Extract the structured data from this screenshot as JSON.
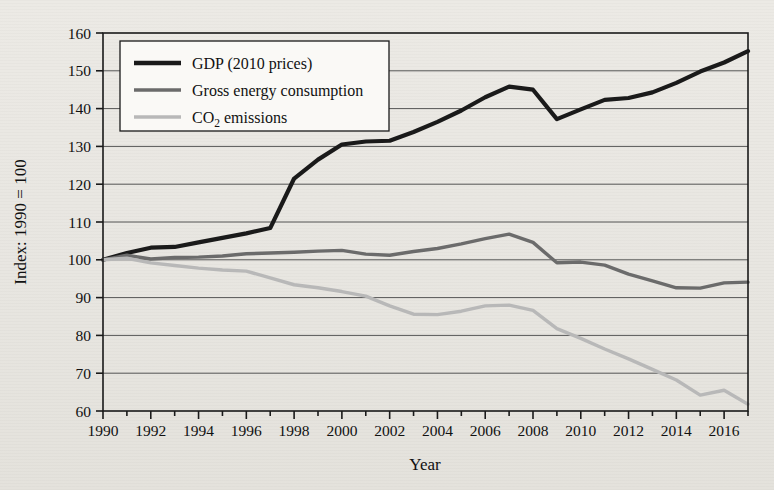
{
  "chart_data": {
    "type": "line",
    "title": "",
    "xlabel": "Year",
    "ylabel": "Index: 1990 = 100",
    "xlim": [
      1990,
      2017
    ],
    "ylim": [
      60,
      160
    ],
    "ytick_step": 10,
    "xtick_label_step": 2,
    "xtick_minor_step": 1,
    "grid": "horizontal",
    "legend_position": "top-left",
    "yticks": [
      60,
      70,
      80,
      90,
      100,
      110,
      120,
      130,
      140,
      150,
      160
    ],
    "xticks": [
      1990,
      1991,
      1992,
      1993,
      1994,
      1995,
      1996,
      1997,
      1998,
      1999,
      2000,
      2001,
      2002,
      2003,
      2004,
      2005,
      2006,
      2007,
      2008,
      2009,
      2010,
      2011,
      2012,
      2013,
      2014,
      2015,
      2016,
      2017
    ],
    "xtick_labels": [
      "1990",
      "1992",
      "1994",
      "1996",
      "1998",
      "2000",
      "2002",
      "2004",
      "2006",
      "2008",
      "2010",
      "2012",
      "2014",
      "2016"
    ],
    "x": [
      1990,
      1991,
      1992,
      1993,
      1994,
      1995,
      1996,
      1997,
      1998,
      1999,
      2000,
      2001,
      2002,
      2003,
      2004,
      2005,
      2006,
      2007,
      2008,
      2009,
      2010,
      2011,
      2012,
      2013,
      2014,
      2015,
      2016,
      2017
    ],
    "series": [
      {
        "name": "GDP (2010 prices)",
        "color": "#1a1a1a",
        "width": 4.2,
        "values": [
          100.0,
          101.8,
          103.2,
          103.4,
          104.6,
          105.8,
          107.0,
          108.4,
          121.5,
          126.5,
          130.5,
          131.3,
          131.5,
          133.8,
          136.5,
          139.5,
          143.0,
          145.8,
          145.0,
          137.2,
          139.8,
          142.3,
          142.8,
          144.3,
          146.8,
          149.8,
          152.2,
          155.2
        ]
      },
      {
        "name": "Gross energy consumption",
        "color": "#6b6b6b",
        "width": 3.4,
        "values": [
          100.0,
          101.2,
          100.2,
          100.6,
          100.7,
          101.0,
          101.6,
          101.8,
          102.0,
          102.3,
          102.5,
          101.5,
          101.2,
          102.2,
          103.0,
          104.2,
          105.6,
          106.8,
          104.6,
          99.2,
          99.4,
          98.6,
          96.2,
          94.4,
          92.6,
          92.5,
          93.9,
          94.1
        ]
      },
      {
        "name": "CO₂ emissions",
        "color": "#b8b8b8",
        "width": 3.4,
        "values": [
          100.0,
          100.4,
          99.2,
          98.5,
          97.8,
          97.3,
          97.0,
          95.2,
          93.4,
          92.6,
          91.6,
          90.4,
          87.8,
          85.6,
          85.5,
          86.4,
          87.8,
          88.0,
          86.6,
          81.8,
          79.2,
          76.4,
          73.8,
          71.0,
          68.2,
          64.2,
          65.5,
          61.8
        ]
      }
    ],
    "legend": [
      {
        "label": "GDP (2010 prices)",
        "color": "#1a1a1a"
      },
      {
        "label": "Gross energy consumption",
        "color": "#6b6b6b"
      },
      {
        "label": "CO2 emissions",
        "color": "#b8b8b8"
      }
    ]
  },
  "legend_text": {
    "item0": "GDP (2010 prices)",
    "item1": "Gross energy consumption",
    "co2_main": "CO",
    "co2_sub": "2",
    "co2_tail": " emissions"
  },
  "axes": {
    "xlabel": "Year",
    "ylabel": "Index: 1990 = 100"
  }
}
